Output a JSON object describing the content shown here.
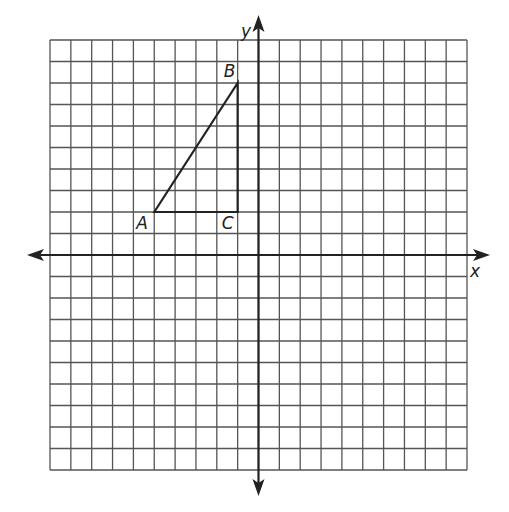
{
  "figure": {
    "type": "coordinate-grid",
    "grid": {
      "xmin": -10,
      "xmax": 10,
      "ymin": -10,
      "ymax": 10,
      "step": 1
    },
    "axes": {
      "x_label": "x",
      "y_label": "y"
    },
    "triangle": {
      "points": [
        {
          "name": "A",
          "x": -5,
          "y": 2
        },
        {
          "name": "B",
          "x": -1,
          "y": 8
        },
        {
          "name": "C",
          "x": -1,
          "y": 2
        }
      ]
    },
    "colors": {
      "grid": "#555555",
      "axis": "#222222",
      "shape": "#222222"
    }
  }
}
